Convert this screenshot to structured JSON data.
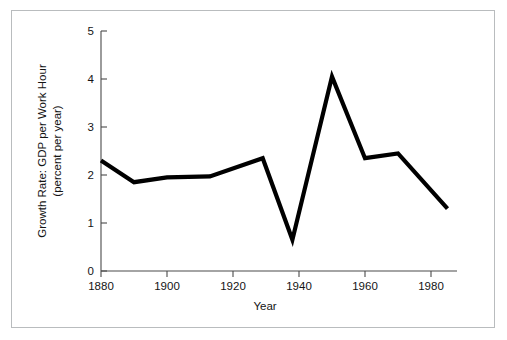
{
  "chart_data": {
    "type": "line",
    "title": "",
    "xlabel": "Year",
    "ylabel": "Growth Rate: GDP per Work Hour\n(percent per year)",
    "ylabel_line1": "Growth Rate: GDP per Work Hour",
    "ylabel_line2": "(percent per year)",
    "xlim": [
      1880,
      1988
    ],
    "ylim": [
      0,
      5
    ],
    "xticks": [
      1880,
      1900,
      1920,
      1940,
      1960,
      1980
    ],
    "xticklabels": [
      "1880",
      "1900",
      "1920",
      "1940",
      "1960",
      "1980"
    ],
    "yticks": [
      0,
      1,
      2,
      3,
      4,
      5
    ],
    "yticklabels": [
      "0",
      "1",
      "2",
      "3",
      "4",
      "5"
    ],
    "grid": false,
    "legend": false,
    "line_color": "#000000",
    "line_width": 4.2,
    "series": [
      {
        "name": "Growth Rate: GDP per Work Hour",
        "x": [
          1880,
          1890,
          1900,
          1913,
          1929,
          1938,
          1950,
          1960,
          1970,
          1985
        ],
        "values": [
          2.3,
          1.85,
          1.95,
          1.97,
          2.35,
          0.65,
          4.05,
          2.35,
          2.45,
          1.3
        ]
      }
    ]
  },
  "figure": {
    "border_color": "#b9bcbe",
    "background": "#ffffff"
  }
}
